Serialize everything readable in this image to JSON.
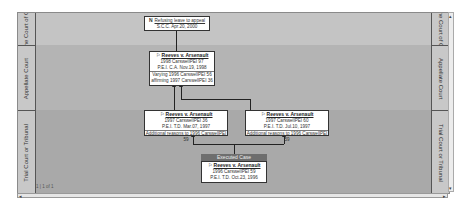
{
  "lanes": [
    {
      "label": "Supreme Court of Canada",
      "short": "Supreme Cou of Canada"
    },
    {
      "label": "Appellate Court"
    },
    {
      "label": "Trial Court or Tribunal"
    }
  ],
  "nodes": {
    "scc": {
      "flag": "N",
      "title": "Refusing leave to appeal",
      "line1": "S.C.C. Apr.20, 2000"
    },
    "appeal": {
      "flag": "⚐",
      "title": "Reeves v. Arsenault",
      "line1": "1998 CarswellPEI 97",
      "line2": "P.E.I. C.A. Nov.19, 1998",
      "line3": "Varying 1996 CarswellPEI 56",
      "line4": "affirming 1997 CarswellPEI 36"
    },
    "trial_left": {
      "flag": "⚐",
      "title": "Reeves v. Arsenault",
      "line1": "1997 CarswellPEI 36",
      "line2": "P.E.I. T.D. Mar.07, 1997",
      "line3": "Additional reasons to 1996 CarswellPEI 59"
    },
    "trial_right": {
      "flag": "⚐",
      "title": "Reeves v. Arsenault",
      "line1": "1997 CarswellPEI 60",
      "line2": "P.E.I. T.D. Jul.10, 1997",
      "line3": "Additional reasons to 1996 CarswellPEI 59"
    },
    "executed": {
      "header": "Executed Case",
      "flag": "⚐",
      "title": "Reeves v. Arsenault",
      "line1": "1996 CarswellPEI 59",
      "line2": "P.E.I. T.D. Oct.23, 1996"
    }
  },
  "scrollbars": {
    "left_arrow": "◂",
    "right_arrow": "▸",
    "up_arrow": "▴",
    "down_arrow": "▾"
  },
  "status_text": "1 | 1 of 1"
}
